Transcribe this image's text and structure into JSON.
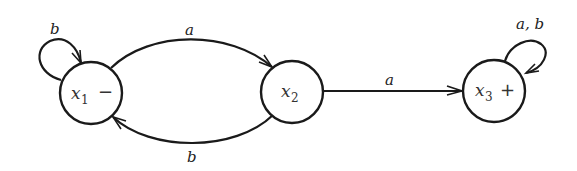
{
  "diagram": {
    "type": "finite-automaton",
    "states": [
      {
        "id": "x1",
        "name": "x",
        "subscript": "1",
        "marker": "−",
        "role": "start",
        "cx": 91,
        "cy": 93,
        "r": 31
      },
      {
        "id": "x2",
        "name": "x",
        "subscript": "2",
        "marker": "",
        "role": "intermediate",
        "cx": 292,
        "cy": 92,
        "r": 31
      },
      {
        "id": "x3",
        "name": "x",
        "subscript": "3",
        "marker": "+",
        "role": "final",
        "cx": 494,
        "cy": 91,
        "r": 31
      }
    ],
    "transitions": [
      {
        "from": "x1",
        "to": "x1",
        "label": "b"
      },
      {
        "from": "x1",
        "to": "x2",
        "label": "a"
      },
      {
        "from": "x2",
        "to": "x1",
        "label": "b"
      },
      {
        "from": "x2",
        "to": "x3",
        "label": "a"
      },
      {
        "from": "x3",
        "to": "x3",
        "label": "a, b"
      }
    ]
  }
}
